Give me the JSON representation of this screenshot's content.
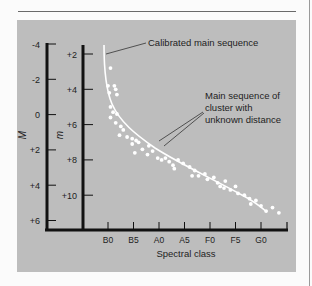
{
  "chart_data": {
    "type": "scatter",
    "title": "",
    "xlabel": "Spectral class",
    "ylabel_left": "M",
    "ylabel_inner": "m",
    "categories": [
      "B0",
      "B5",
      "A0",
      "A5",
      "F0",
      "F5",
      "G0"
    ],
    "axis_M": {
      "ticks": [
        "-4",
        "-2",
        "0",
        "+2",
        "+4",
        "+6"
      ],
      "range": [
        -4,
        6
      ],
      "inverted": true
    },
    "axis_m": {
      "ticks": [
        "+2",
        "+4",
        "+6",
        "+8",
        "+10"
      ],
      "range": [
        1.5,
        11.5
      ],
      "inverted": true
    },
    "series": [
      {
        "name": "Calibrated main sequence",
        "kind": "line",
        "note": "smooth curve in absolute magnitude M",
        "points_M": [
          [
            -0.2,
            -4.0
          ],
          [
            0.0,
            -2.5
          ],
          [
            0.3,
            -1.0
          ],
          [
            0.6,
            0.0
          ],
          [
            1.0,
            0.8
          ],
          [
            1.5,
            1.6
          ],
          [
            2.0,
            2.2
          ],
          [
            3.0,
            3.0
          ],
          [
            4.0,
            3.6
          ],
          [
            5.0,
            4.1
          ],
          [
            6.0,
            4.6
          ],
          [
            6.6,
            4.9
          ]
        ]
      },
      {
        "name": "Main sequence of cluster with unknown distance",
        "kind": "scatter",
        "note": "apparent magnitude m vs spectral class index (B0=0 ... G0=6)",
        "points_m": [
          [
            0.1,
            2.8
          ],
          [
            0.0,
            3.8
          ],
          [
            0.25,
            3.8
          ],
          [
            0.3,
            4.0
          ],
          [
            0.05,
            4.2
          ],
          [
            0.35,
            4.3
          ],
          [
            0.1,
            5.0
          ],
          [
            0.2,
            5.3
          ],
          [
            0.35,
            5.4
          ],
          [
            0.1,
            5.6
          ],
          [
            0.3,
            5.9
          ],
          [
            0.5,
            6.1
          ],
          [
            0.6,
            6.3
          ],
          [
            0.45,
            6.6
          ],
          [
            0.75,
            6.7
          ],
          [
            0.95,
            6.8
          ],
          [
            1.1,
            6.9
          ],
          [
            0.95,
            7.1
          ],
          [
            1.2,
            7.0
          ],
          [
            1.35,
            7.4
          ],
          [
            1.05,
            7.6
          ],
          [
            1.6,
            7.2
          ],
          [
            1.75,
            7.5
          ],
          [
            1.55,
            7.7
          ],
          [
            1.95,
            7.9
          ],
          [
            2.1,
            8.0
          ],
          [
            2.25,
            7.9
          ],
          [
            2.4,
            8.1
          ],
          [
            2.55,
            8.3
          ],
          [
            2.75,
            8.0
          ],
          [
            2.6,
            8.5
          ],
          [
            2.95,
            8.2
          ],
          [
            3.2,
            8.4
          ],
          [
            3.4,
            8.6
          ],
          [
            3.3,
            8.9
          ],
          [
            3.55,
            8.9
          ],
          [
            3.8,
            8.8
          ],
          [
            3.9,
            9.1
          ],
          [
            4.15,
            9.0
          ],
          [
            4.3,
            9.3
          ],
          [
            4.4,
            9.5
          ],
          [
            4.6,
            9.2
          ],
          [
            4.55,
            9.6
          ],
          [
            4.8,
            9.7
          ],
          [
            5.0,
            9.5
          ],
          [
            5.1,
            9.9
          ],
          [
            5.35,
            10.0
          ],
          [
            5.55,
            10.2
          ],
          [
            5.6,
            10.5
          ],
          [
            5.8,
            10.3
          ],
          [
            6.0,
            10.6
          ],
          [
            6.2,
            10.9
          ],
          [
            6.45,
            10.7
          ],
          [
            6.7,
            11.0
          ]
        ]
      }
    ],
    "annotations": [
      {
        "text": "Calibrated main sequence",
        "target": "calibrated curve"
      },
      {
        "text_lines": [
          "Main sequence of",
          "cluster with",
          "unknown distance"
        ],
        "target": "cluster points"
      }
    ],
    "grid": false,
    "legend": "none (annotations with leader lines)"
  },
  "labels": {
    "M_axis": "M",
    "m_axis": "m",
    "x_axis": "Spectral class",
    "callout_calibrated": "Calibrated main sequence",
    "callout_cluster_1": "Main sequence of",
    "callout_cluster_2": "cluster with",
    "callout_cluster_3": "unknown distance",
    "M_ticks": [
      "-4",
      "-2",
      "0",
      "+2",
      "+4",
      "+6"
    ],
    "m_ticks": [
      "+2",
      "+4",
      "+6",
      "+8",
      "+10"
    ],
    "x_ticks": [
      "B0",
      "B5",
      "A0",
      "A5",
      "F0",
      "F5",
      "G0"
    ]
  },
  "colors": {
    "panel": "#bdbdbd",
    "axis": "#111111",
    "points": "#ffffff",
    "curve": "#ffffff",
    "text": "#1e1e1e"
  }
}
